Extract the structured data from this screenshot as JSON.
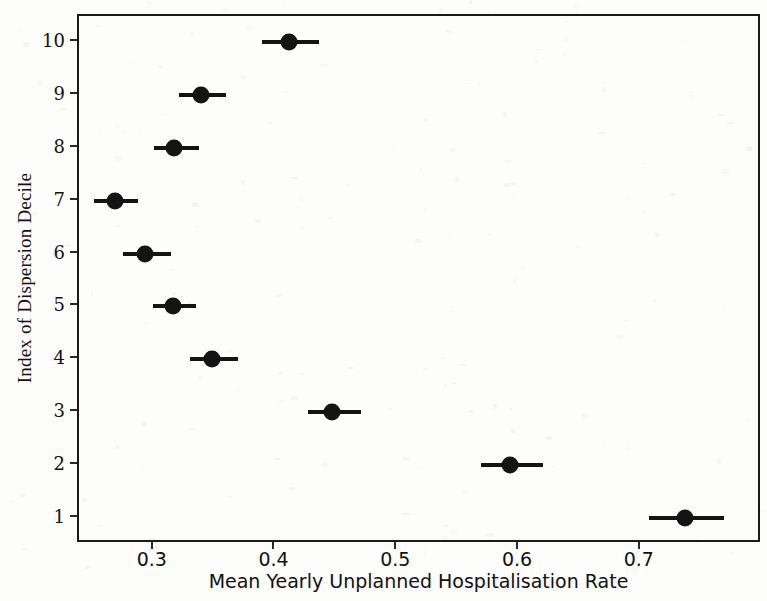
{
  "chart_data": {
    "type": "scatter",
    "title": "",
    "xlabel": "Mean Yearly Unplanned Hospitalisation Rate",
    "ylabel": "Index of Dispersion Decile",
    "xlim": [
      0.2386,
      0.7996
    ],
    "ylim": [
      0.5,
      10.5
    ],
    "grid": false,
    "legend": "none",
    "orientation": "horizontal",
    "xticks": [
      0.3,
      0.4,
      0.5,
      0.6,
      0.7
    ],
    "xtick_labels": [
      "0.3",
      "0.4",
      "0.5",
      "0.6",
      "0.7"
    ],
    "yticks": [
      1,
      2,
      3,
      4,
      5,
      6,
      7,
      8,
      9,
      10
    ],
    "ytick_labels": [
      "1",
      "2",
      "3",
      "4",
      "5",
      "6",
      "7",
      "8",
      "9",
      "10"
    ],
    "categories": [
      10,
      9,
      8,
      7,
      6,
      5,
      4,
      3,
      2,
      1
    ],
    "series": [
      {
        "name": "Mean yearly unplanned hospitalisation rate",
        "marker": "circle",
        "color": "#141414",
        "points": [
          {
            "decile": 10,
            "value": 0.411,
            "ci_low": 0.389,
            "ci_high": 0.436
          },
          {
            "decile": 9,
            "value": 0.339,
            "ci_low": 0.321,
            "ci_high": 0.359
          },
          {
            "decile": 8,
            "value": 0.317,
            "ci_low": 0.3,
            "ci_high": 0.337
          },
          {
            "decile": 7,
            "value": 0.268,
            "ci_low": 0.251,
            "ci_high": 0.287
          },
          {
            "decile": 6,
            "value": 0.293,
            "ci_low": 0.275,
            "ci_high": 0.314
          },
          {
            "decile": 5,
            "value": 0.316,
            "ci_low": 0.299,
            "ci_high": 0.335
          },
          {
            "decile": 4,
            "value": 0.348,
            "ci_low": 0.33,
            "ci_high": 0.369
          },
          {
            "decile": 3,
            "value": 0.446,
            "ci_low": 0.427,
            "ci_high": 0.47
          },
          {
            "decile": 2,
            "value": 0.593,
            "ci_low": 0.569,
            "ci_high": 0.62
          },
          {
            "decile": 1,
            "value": 0.736,
            "ci_low": 0.707,
            "ci_high": 0.768
          }
        ]
      }
    ]
  },
  "figure": {
    "axis_color": "#1a1a1a",
    "marker_color": "#141414",
    "background": "#fdfdfc"
  }
}
